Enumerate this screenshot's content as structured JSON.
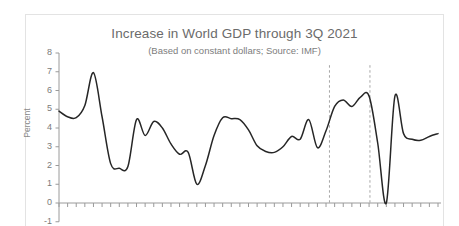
{
  "chart_data": {
    "type": "line",
    "title": "Increase in World GDP through 3Q 2021",
    "subtitle": "(Based on constant dollars; Source: IMF)",
    "xlabel": "",
    "ylabel": "Percent",
    "ylim": [
      -1,
      8
    ],
    "ytick_labels": [
      "8",
      "7",
      "6",
      "5",
      "4",
      "3",
      "2",
      "1",
      "0",
      "-1"
    ],
    "ytick_values": [
      8,
      7,
      6,
      5,
      4,
      3,
      2,
      1,
      0,
      -1
    ],
    "grid": false,
    "legend": "none",
    "line_color": "#262626",
    "axis_color": "#9a9a9a",
    "title_color": "#6b6b6b",
    "frame_color": "#e3e3e3",
    "x_tick_count": 45,
    "x_axis_labels_visible": false,
    "annotations": [
      {
        "name": "reference-line-1",
        "type": "vertical-dashed",
        "x_index": 31.4,
        "color": "#a6a6a6"
      },
      {
        "name": "reference-line-2",
        "type": "vertical-dashed",
        "x_index": 36.1,
        "color": "#a6a6a6"
      }
    ],
    "series": [
      {
        "name": "World GDP growth",
        "values": [
          4.9,
          4.6,
          4.55,
          5.2,
          6.95,
          4.6,
          2.1,
          1.85,
          1.95,
          4.45,
          3.6,
          4.35,
          4.0,
          3.15,
          2.6,
          2.7,
          1.0,
          2.0,
          3.6,
          4.55,
          4.5,
          4.45,
          3.9,
          3.05,
          2.75,
          2.7,
          3.0,
          3.55,
          3.4,
          4.45,
          2.95,
          3.85,
          5.15,
          5.5,
          5.15,
          5.65,
          5.7,
          3.2,
          0.0,
          5.7,
          3.7,
          3.4,
          3.35,
          3.55,
          3.7
        ]
      }
    ]
  },
  "axis": {
    "y_title": "Percent"
  }
}
